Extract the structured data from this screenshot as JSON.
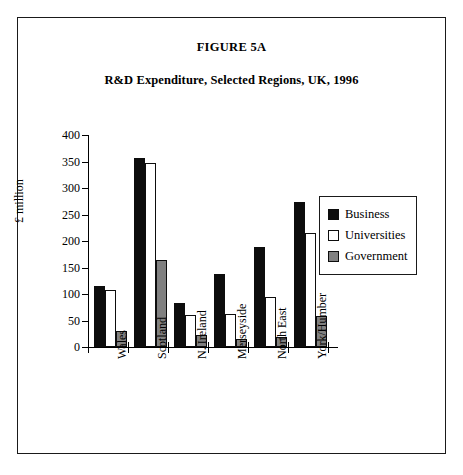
{
  "figure": {
    "label": "FIGURE 5A",
    "title": "R&D Expenditure, Selected Regions, UK, 1996"
  },
  "chart_data": {
    "type": "bar",
    "title": "R&D Expenditure, Selected Regions, UK, 1996",
    "xlabel": "",
    "ylabel": "£ million",
    "ylim": [
      0,
      400
    ],
    "yticks": [
      0,
      50,
      100,
      150,
      200,
      250,
      300,
      350,
      400
    ],
    "grid": false,
    "legend_position": "right",
    "categories": [
      "Wales",
      "Scotland",
      "N. Ireland",
      "Merseyside",
      "North East",
      "York/Humber"
    ],
    "series": [
      {
        "name": "Business",
        "color": "#0d0d0d",
        "values": [
          115,
          357,
          83,
          138,
          188,
          273
        ]
      },
      {
        "name": "Universities",
        "color": "#ffffff",
        "values": [
          107,
          347,
          60,
          62,
          95,
          215
        ]
      },
      {
        "name": "Government",
        "color": "#808080",
        "values": [
          30,
          165,
          22,
          15,
          18,
          58
        ]
      }
    ]
  }
}
